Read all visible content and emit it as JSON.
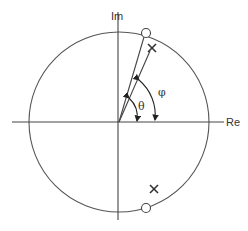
{
  "diagram": {
    "type": "z-plane pole-zero diagram",
    "axes": {
      "real_label": "Re",
      "imag_label": "Im"
    },
    "unit_circle": {
      "center": [
        119,
        122
      ],
      "radius": 90
    },
    "angles": {
      "theta_label": "θ",
      "phi_label": "φ"
    },
    "poles": [
      {
        "marker": "×",
        "position": "upper",
        "x": 152,
        "y": 48
      },
      {
        "marker": "×",
        "position": "lower",
        "x": 154,
        "y": 189
      }
    ],
    "zeros": [
      {
        "marker": "○",
        "position": "upper",
        "x": 146,
        "y": 33
      },
      {
        "marker": "○",
        "position": "lower",
        "x": 146,
        "y": 208
      }
    ],
    "colors": {
      "stroke": "#444444",
      "text": "#333333"
    }
  }
}
